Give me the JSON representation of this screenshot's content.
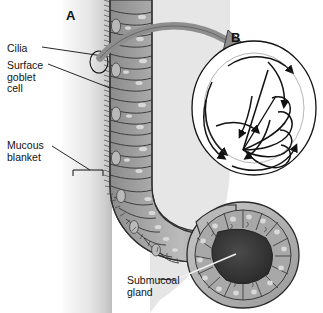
{
  "figure": {
    "width": 323,
    "height": 313,
    "background_color": "#ffffff"
  },
  "panels": [
    {
      "id": "A",
      "letter": "A",
      "caption": "Cross-section of respiratory mucosa showing pseudostratified ciliated columnar epithelium, surface goblet cells, overlying mucous blanket and a submucosal gland"
    },
    {
      "id": "B",
      "letter": "B",
      "caption": "Magnified inset of a single cilium illustrating the beat cycle: effective (power) stroke and recovery stroke directions"
    }
  ],
  "labels": {
    "cilia": "Cilia",
    "surface_goblet_cell": "Surface\ngoblet\ncell",
    "mucous_blanket": "Mucous\nblanket",
    "submucosal_gland": "Submucoal\ngland"
  },
  "colors": {
    "background": "#ffffff",
    "outline": "#1a1a1a",
    "epithelium_fill": "#9d9d9d",
    "epithelium_light": "#c2c2c2",
    "epithelium_dark": "#6e6e6e",
    "cell_highlight": "#d8d8d8",
    "nucleus": "#e2e2e2",
    "mucous_blanket_light": "#f2f2f2",
    "mucous_blanket_mid": "#d6d6d6",
    "lumen_tissue": "#bdbdbd",
    "gland_lumen": "#3a3a3a",
    "gland_wall": "#8e8e8e",
    "connector_arrow": "#808080",
    "label_text": "#121212",
    "leader_line": "#1a1a1a"
  },
  "annotations": {
    "connector_arrow": {
      "name": "magnification-arrow",
      "from_panel": "A",
      "to_panel": "B",
      "description": "Thick grey curved arrow linking the circled cilium region in panel A to the magnified inset in panel B"
    },
    "cilia_marker_circle": {
      "name": "cilia-highlight-circle",
      "description": "Small ellipse on the epithelial surface marking the cilia region that is magnified"
    },
    "mucous_bracket": {
      "name": "mucous-blanket-bracket",
      "description": "Square bracket spanning the thickness of the mucous blanket layer"
    },
    "beat_arrows": {
      "name": "ciliary-beat-arrows",
      "count": 8,
      "description": "Curved directional arrows inside panel B showing the circular path of the ciliary beat cycle"
    }
  }
}
